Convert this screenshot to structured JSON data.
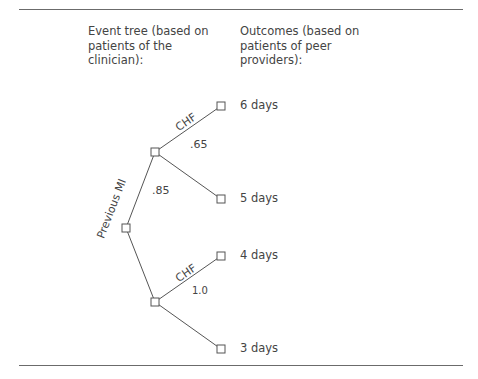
{
  "headers": {
    "event_tree": "Event tree (based on patients of the clinician):",
    "outcomes": "Outcomes (based on patients of peer providers):"
  },
  "tree": {
    "branch_labels": {
      "previous_mi": "Previous MI",
      "chf_upper": "CHF",
      "chf_lower": "CHF"
    },
    "probabilities": {
      "previous_mi": ".85",
      "chf_upper": ".65",
      "chf_lower": "1.0"
    }
  },
  "outcomes": [
    "6 days",
    "5 days",
    "4 days",
    "3 days"
  ],
  "colors": {
    "line": "#555555",
    "text": "#444444"
  }
}
